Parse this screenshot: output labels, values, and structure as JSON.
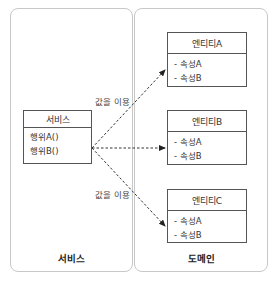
{
  "diagram": {
    "panels": [
      {
        "id": "service",
        "label": "서비스"
      },
      {
        "id": "domain",
        "label": "도메인"
      }
    ],
    "service_box": {
      "title": "서비스",
      "members": [
        "행위A()",
        "행위B()"
      ]
    },
    "entities": [
      {
        "title": "엔티티A",
        "members": [
          "- 속성A",
          "- 속성B"
        ]
      },
      {
        "title": "엔티티B",
        "members": [
          "- 속성A",
          "- 속성B"
        ]
      },
      {
        "title": "엔티티C",
        "members": [
          "- 속성A",
          "- 속성B"
        ]
      }
    ],
    "edges": [
      {
        "from": "서비스",
        "to": "엔티티A",
        "style": "dashed-arrow",
        "label": "값을 이용"
      },
      {
        "from": "서비스",
        "to": "엔티티B",
        "style": "dashed-arrow",
        "label": ""
      },
      {
        "from": "서비스",
        "to": "엔티티C",
        "style": "dashed-arrow",
        "label": "값을 이용"
      }
    ],
    "colors": {
      "panel_border": "#c8c8c8",
      "box_border": "#555555",
      "arrow": "#333333"
    }
  }
}
